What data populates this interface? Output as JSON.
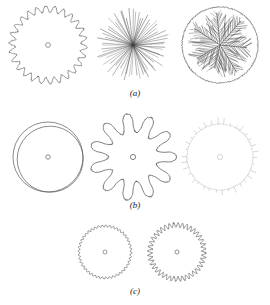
{
  "figure": {
    "background_color": "#ffffff",
    "ink_color": "#3a3a3a",
    "faint_ink_color": "#b9b9b9",
    "width": 270,
    "height": 305,
    "rows": [
      {
        "id": "a",
        "label": "(a)",
        "label_y": 88,
        "panels": [
          {
            "id": "a1",
            "name": "wavy-dendritic-disc",
            "kind": "crenellated-circle",
            "cx": 48,
            "cy": 45,
            "r": 36,
            "lobes": 26,
            "amplitude": 3.2,
            "stroke": "#5a5a5a",
            "stroke_width": 0.6,
            "center_marker": true,
            "center_marker_r": 2.4,
            "seed": 11
          },
          {
            "id": "a2",
            "name": "radial-needle-starburst",
            "kind": "radial-spokes",
            "cx": 133,
            "cy": 45,
            "r": 38,
            "spokes": 64,
            "jitter": 0.1,
            "length_var": 0.3,
            "stroke": "#444444",
            "stroke_width": 0.5,
            "center_marker": false,
            "seed": 23
          },
          {
            "id": "a3",
            "name": "branched-dendrite-disc",
            "kind": "branching-tree",
            "cx": 220,
            "cy": 45,
            "r": 38,
            "primary_branches": 7,
            "side_branches": 11,
            "stroke": "#3a3a3a",
            "stroke_width": 0.5,
            "outline": true,
            "center_marker": false,
            "seed": 37
          }
        ]
      },
      {
        "id": "b",
        "label": "(b)",
        "label_y": 200,
        "panels": [
          {
            "id": "b1",
            "name": "double-offset-circle",
            "kind": "double-circle",
            "cx": 48,
            "cy": 157,
            "r": 35,
            "offset_x": 2.2,
            "offset_y": 2.2,
            "inner_r": 33,
            "stroke": "#5a5a5a",
            "stroke_width": 0.7,
            "center_marker": true,
            "center_marker_r": 2.2,
            "seed": 5
          },
          {
            "id": "b2",
            "name": "lobed-flower-disc",
            "kind": "lobed-flower",
            "cx": 133,
            "cy": 157,
            "r": 34,
            "lobes": 11,
            "amplitude": 9.5,
            "sharpness": 2.0,
            "stroke": "#4a4a4a",
            "stroke_width": 0.7,
            "center_marker": true,
            "center_marker_r": 2.6,
            "seed": 17
          },
          {
            "id": "b3",
            "name": "faint-ticked-circle",
            "kind": "ticked-circle",
            "cx": 220,
            "cy": 157,
            "r": 33,
            "ticks": 34,
            "tick_len": 4.5,
            "stroke": "#bdbdbd",
            "stroke_width": 0.6,
            "center_marker": true,
            "center_marker_r": 2.6,
            "seed": 29
          }
        ]
      },
      {
        "id": "c",
        "label": "(c)",
        "label_y": 286,
        "panels": [
          {
            "id": "c1",
            "name": "fine-scalloped-disc-small",
            "kind": "crenellated-circle",
            "cx": 105,
            "cy": 252,
            "r": 26,
            "lobes": 44,
            "amplitude": 1.0,
            "stroke": "#5a5a5a",
            "stroke_width": 0.6,
            "center_marker": true,
            "center_marker_r": 2.0,
            "seed": 41
          },
          {
            "id": "c2",
            "name": "coarse-scalloped-disc-small",
            "kind": "crenellated-circle",
            "cx": 177,
            "cy": 252,
            "r": 27,
            "lobes": 40,
            "amplitude": 2.3,
            "stroke": "#4f4f4f",
            "stroke_width": 0.6,
            "center_marker": true,
            "center_marker_r": 2.0,
            "seed": 53
          }
        ]
      }
    ]
  }
}
